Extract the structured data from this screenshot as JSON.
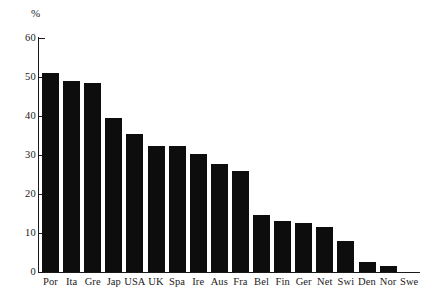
{
  "chart_data": {
    "type": "bar",
    "title": "",
    "subtitle": "",
    "xlabel": "",
    "ylabel": "%",
    "ylim": [
      0,
      60
    ],
    "yticks": [
      0,
      10,
      20,
      30,
      40,
      50,
      60
    ],
    "grid": false,
    "legend": false,
    "bar_color": "#0d0d0d",
    "axis_color": "#1a1a1a",
    "categories": [
      "Por",
      "Ita",
      "Gre",
      "Jap",
      "USA",
      "UK",
      "Spa",
      "Ire",
      "Aus",
      "Fra",
      "Bel",
      "Fin",
      "Ger",
      "Net",
      "Swi",
      "Den",
      "Nor",
      "Swe"
    ],
    "values": [
      51,
      49,
      48.5,
      39.5,
      35.5,
      32.3,
      32.3,
      30.3,
      27.8,
      26,
      14.5,
      13,
      12.5,
      11.5,
      8,
      2.5,
      1.5,
      0
    ],
    "annotations": []
  }
}
